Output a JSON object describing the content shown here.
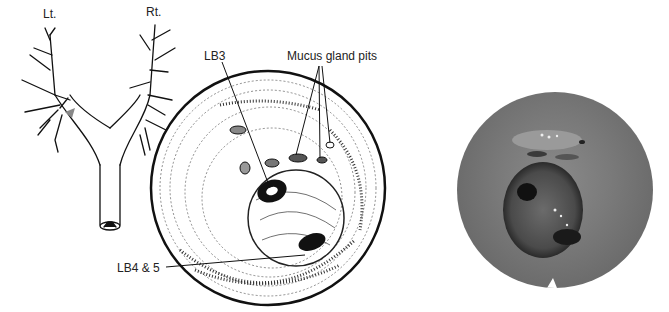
{
  "figure": {
    "panels": [
      {
        "id": "bronchial-tree",
        "description": "Line drawing of bronchial tree with trachea"
      },
      {
        "id": "endoscopic-drawing",
        "description": "Hatched illustration of bronchoscopic view"
      },
      {
        "id": "endoscopic-photo",
        "description": "Grayscale bronchoscopic photograph"
      }
    ],
    "labels": {
      "left": "Lt.",
      "right": "Rt.",
      "lb3": "LB3",
      "mucus": "Mucus gland pits",
      "lb45": "LB4 & 5"
    },
    "colors": {
      "ink": "#111111",
      "background": "#ffffff",
      "photo_mid": "#7a7a7a",
      "photo_dark": "#1a1a1a"
    }
  }
}
